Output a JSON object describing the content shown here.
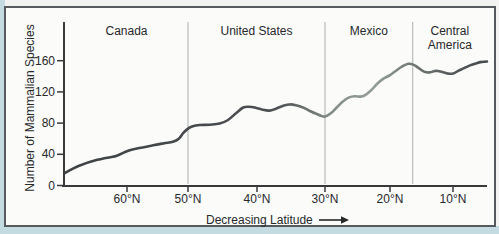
{
  "chart_data": {
    "type": "line",
    "title": "",
    "xlabel": "Decreasing Latitude",
    "ylabel": "Number of Mammalian Species",
    "x_ticks": [
      {
        "lat": 60,
        "label": "60°N"
      },
      {
        "lat": 50,
        "label": "50°N"
      },
      {
        "lat": 40,
        "label": "40°N"
      },
      {
        "lat": 30,
        "label": "30°N"
      },
      {
        "lat": 20,
        "label": "20°N"
      },
      {
        "lat": 10,
        "label": "10°N"
      }
    ],
    "y_ticks": [
      0,
      40,
      80,
      120,
      160
    ],
    "ylim": [
      0,
      210
    ],
    "xlim_lat": [
      71.5,
      4.8
    ],
    "x_axis_direction": "latitude decreases left to right",
    "grid": "off",
    "legend": "none",
    "regions": [
      {
        "label": "Canada",
        "lat_from": 71.5,
        "lat_to": 50
      },
      {
        "label": "United States",
        "lat_from": 50,
        "lat_to": 30
      },
      {
        "label": "Mexico",
        "lat_from": 30,
        "lat_to": 16.4
      },
      {
        "label": "Central America",
        "lat_from": 16.4,
        "lat_to": 4.8
      }
    ],
    "series": [
      {
        "name": "Number of mammalian species vs. latitude",
        "points": [
          [
            71.5,
            16
          ],
          [
            69,
            25
          ],
          [
            65.5,
            33
          ],
          [
            62,
            38
          ],
          [
            60,
            44
          ],
          [
            58,
            48
          ],
          [
            56,
            51
          ],
          [
            54,
            54
          ],
          [
            52.5,
            56
          ],
          [
            51.5,
            60
          ],
          [
            50.8,
            67
          ],
          [
            50,
            73
          ],
          [
            49.3,
            76
          ],
          [
            48.3,
            77.5
          ],
          [
            46.8,
            78
          ],
          [
            45.4,
            79.5
          ],
          [
            44.2,
            84
          ],
          [
            43,
            93
          ],
          [
            42,
            100
          ],
          [
            41.2,
            101
          ],
          [
            40.3,
            100
          ],
          [
            39.3,
            97.5
          ],
          [
            38.2,
            96
          ],
          [
            37.2,
            98.5
          ],
          [
            36.2,
            102
          ],
          [
            35.1,
            104
          ],
          [
            34.1,
            102.5
          ],
          [
            33.1,
            99.5
          ],
          [
            32.2,
            95.5
          ],
          [
            31.3,
            92
          ],
          [
            30.6,
            89.5
          ],
          [
            30,
            88.5
          ],
          [
            29.1,
            92.5
          ],
          [
            28.2,
            100
          ],
          [
            27.2,
            108
          ],
          [
            26.3,
            113
          ],
          [
            25.4,
            114.5
          ],
          [
            24.5,
            114
          ],
          [
            23.7,
            116.5
          ],
          [
            22.8,
            123
          ],
          [
            21.9,
            131
          ],
          [
            21,
            137
          ],
          [
            20,
            141.5
          ],
          [
            19,
            147.5
          ],
          [
            18.1,
            152.5
          ],
          [
            17.1,
            156
          ],
          [
            16.3,
            155
          ],
          [
            15.6,
            151.5
          ],
          [
            14.6,
            146
          ],
          [
            13.7,
            145
          ],
          [
            12.7,
            147
          ],
          [
            11.7,
            145.5
          ],
          [
            10.8,
            143.5
          ],
          [
            10,
            143.5
          ],
          [
            9.2,
            147
          ],
          [
            8.3,
            150.5
          ],
          [
            7.4,
            154
          ],
          [
            6.5,
            156.5
          ],
          [
            5.6,
            158.5
          ],
          [
            4.8,
            159
          ]
        ]
      }
    ],
    "layout": {
      "lat_px_anchors": [
        [
          71.5,
          65
        ],
        [
          60,
          127
        ],
        [
          50,
          188
        ],
        [
          40,
          257
        ],
        [
          30,
          325
        ],
        [
          20,
          390
        ],
        [
          10,
          453
        ],
        [
          4.8,
          487
        ]
      ],
      "y_zero_px": 185.5,
      "px_per_unit_y": 0.78,
      "axis_top_px": 22,
      "axis_bottom_px": 186,
      "axis_left_px": 64,
      "axis_right_px": 487
    }
  },
  "colors": {
    "page_margin": "#c3dbe1",
    "panel_background": "#fbfbfa",
    "panel_border": "#565a5d",
    "axis": "#37393a",
    "text": "#26282a",
    "divider": "#b8bdba",
    "line_gradient": [
      {
        "offset": 0,
        "color": "#3e4245"
      },
      {
        "offset": 0.5,
        "color": "#4b4f51"
      },
      {
        "offset": 0.63,
        "color": "#828c86"
      },
      {
        "offset": 0.73,
        "color": "#949e97"
      },
      {
        "offset": 0.83,
        "color": "#6f7772"
      },
      {
        "offset": 0.92,
        "color": "#53585a"
      },
      {
        "offset": 1,
        "color": "#464a4c"
      }
    ]
  }
}
